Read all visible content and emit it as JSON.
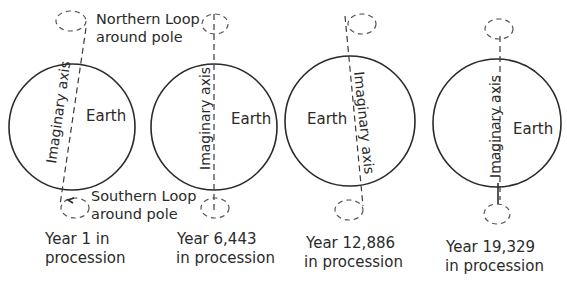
{
  "annotations": {
    "northern_loop_line1": "Northern Loop",
    "northern_loop_line2": "around pole",
    "southern_loop_line1": "Southern Loop",
    "southern_loop_line2": "around pole"
  },
  "panels": [
    {
      "earth_label": "Earth",
      "axis_label": "Imaginary axis",
      "caption_line1": "Year 1 in",
      "caption_line2": "procession"
    },
    {
      "earth_label": "Earth",
      "axis_label": "Imaginary axis",
      "caption_line1": "Year 6,443",
      "caption_line2": "in procession"
    },
    {
      "earth_label": "Earth",
      "axis_label": "Imaginary axis",
      "caption_line1": "Year 12,886",
      "caption_line2": "in procession"
    },
    {
      "earth_label": "Earth",
      "axis_label": "Imaginary axis",
      "caption_line1": "Year 19,329",
      "caption_line2": "in procession"
    }
  ]
}
